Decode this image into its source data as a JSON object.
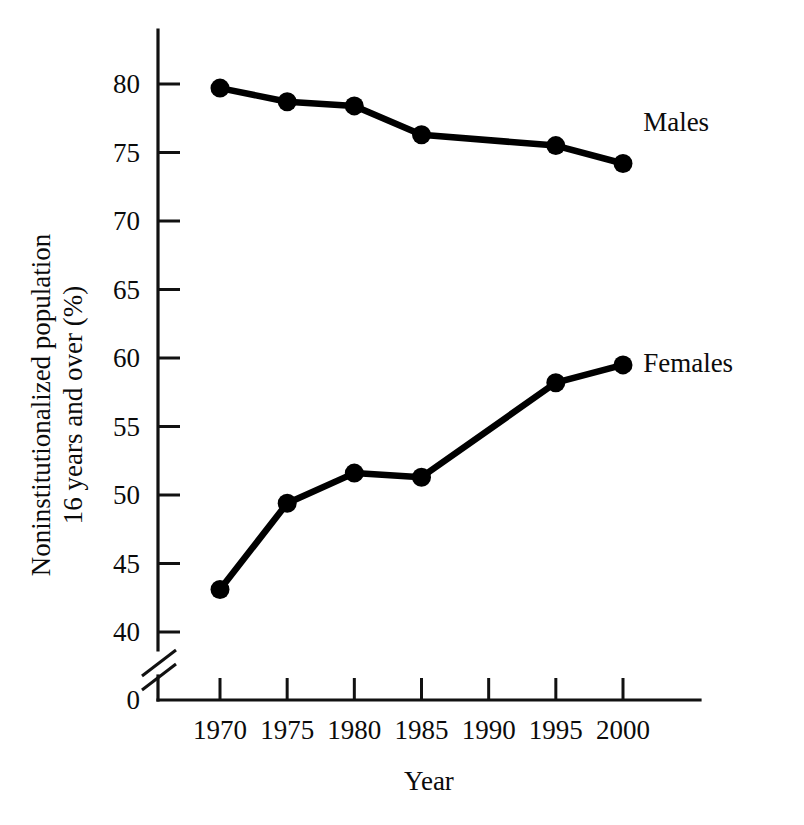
{
  "chart_data": {
    "type": "line",
    "title": "",
    "xlabel": "Year",
    "ylabel": "Noninstitutionalized population 16 years and over (%)",
    "ylabel_line1": "Noninstitutionalized population",
    "ylabel_line2": "16 years and over (%)",
    "x": [
      1970,
      1975,
      1980,
      1985,
      1990,
      1995,
      2000
    ],
    "categories": [
      "1970",
      "1975",
      "1980",
      "1985",
      "1990",
      "1995",
      "2000"
    ],
    "xlim": [
      1966.5,
      2002.5
    ],
    "ylim": [
      40,
      82
    ],
    "yticks": [
      40,
      45,
      50,
      55,
      60,
      65,
      70,
      75,
      80
    ],
    "ytick_labels": [
      "40",
      "45",
      "50",
      "55",
      "60",
      "65",
      "70",
      "75",
      "80"
    ],
    "y_origin_label": "0",
    "axis_break": true,
    "grid": false,
    "legend_position": "inline-right",
    "series": [
      {
        "name": "Males",
        "label": "Males",
        "color": "#000000",
        "x": [
          1970,
          1975,
          1980,
          1985,
          1995,
          2000
        ],
        "values": [
          79.7,
          78.7,
          78.4,
          76.3,
          75.5,
          74.2
        ],
        "markers_at": [
          1970,
          1975,
          1980,
          1985,
          1995,
          2000
        ],
        "label_x": 2001.5,
        "label_y": 77.2
      },
      {
        "name": "Females",
        "label": "Females",
        "color": "#000000",
        "x": [
          1970,
          1975,
          1980,
          1985,
          1995,
          2000
        ],
        "values": [
          43.1,
          49.4,
          51.6,
          51.3,
          58.2,
          59.5
        ],
        "markers_at": [
          1970,
          1975,
          1980,
          1985,
          1995,
          2000
        ],
        "label_x": 2001.5,
        "label_y": 59.6
      }
    ]
  }
}
